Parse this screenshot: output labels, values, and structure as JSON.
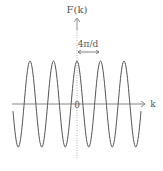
{
  "diagram": {
    "y_axis_label": "F(k)",
    "x_axis_label": "k",
    "origin_label": "0",
    "period_annotation": "4π/d",
    "colors": {
      "curve": "#555555",
      "axis": "#777777",
      "dotted_axis": "#999999",
      "text": "#555555"
    }
  },
  "chart_data": {
    "type": "line",
    "title": "",
    "xlabel": "k",
    "ylabel": "F(k)",
    "function": "cosine",
    "period_label": "4π/d",
    "peaks_visible": 5,
    "troughs_visible": 6
  }
}
